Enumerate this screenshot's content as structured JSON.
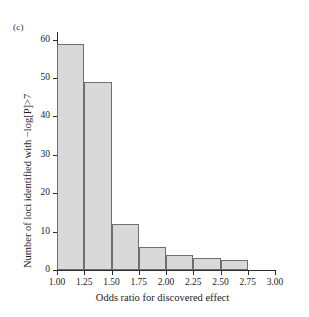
{
  "figure": {
    "panel_label": "(c)",
    "background_color": "#ffffff"
  },
  "chart_data": {
    "type": "bar",
    "title": "",
    "subtitle": "",
    "panel": "(c)",
    "xlabel": "Odds ratio for discovered effect",
    "ylabel": "Number of loci identified with −log[P]>7",
    "xlim": [
      1.0,
      3.0
    ],
    "ylim": [
      0,
      62
    ],
    "grid": false,
    "legend": null,
    "bar_style": {
      "fill_color": "#d9d9d9",
      "edge_color": "#6f6f6f"
    },
    "bin_edges": [
      1.0,
      1.25,
      1.5,
      1.75,
      2.0,
      2.25,
      2.5,
      2.75
    ],
    "categories": [
      "1.00-1.25",
      "1.25-1.50",
      "1.50-1.75",
      "1.75-2.00",
      "2.00-2.25",
      "2.25-2.50",
      "2.50-2.75"
    ],
    "values": [
      59,
      49,
      12,
      6,
      4,
      3,
      2.5
    ],
    "xticks": [
      {
        "value": 1.0,
        "label": "1.00"
      },
      {
        "value": 1.25,
        "label": "1.25"
      },
      {
        "value": 1.5,
        "label": "1.50"
      },
      {
        "value": 1.75,
        "label": "1.75"
      },
      {
        "value": 2.0,
        "label": "2.00"
      },
      {
        "value": 2.25,
        "label": "2.25"
      },
      {
        "value": 2.5,
        "label": "2.50"
      },
      {
        "value": 2.75,
        "label": "2.75"
      },
      {
        "value": 3.0,
        "label": "3.00"
      }
    ],
    "yticks": [
      {
        "value": 0,
        "label": "0"
      },
      {
        "value": 10,
        "label": "10"
      },
      {
        "value": 20,
        "label": "20"
      },
      {
        "value": 30,
        "label": "30"
      },
      {
        "value": 40,
        "label": "40"
      },
      {
        "value": 50,
        "label": "50"
      },
      {
        "value": 60,
        "label": "60"
      }
    ]
  }
}
